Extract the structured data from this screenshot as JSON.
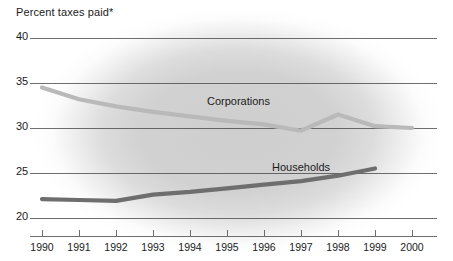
{
  "chart_data": {
    "type": "line",
    "title": "Percent taxes paid*",
    "xlabel": "",
    "ylabel": "",
    "x": [
      1990,
      1991,
      1992,
      1993,
      1994,
      1995,
      1996,
      1997,
      1998,
      1999,
      2000
    ],
    "categories": [
      "1990",
      "1991",
      "1992",
      "1993",
      "1994",
      "1995",
      "1996",
      "1997",
      "1998",
      "1999",
      "2000"
    ],
    "ylim": [
      20,
      40
    ],
    "yticks": [
      40,
      35,
      30,
      25,
      20
    ],
    "ytick_labels": [
      "40",
      "35",
      "30",
      "25",
      "20"
    ],
    "xlim": [
      1990,
      2000
    ],
    "grid": "horizontal",
    "legend": "inline-labels",
    "series": [
      {
        "name": "Corporations",
        "color": "#b9b9b9",
        "label_position": "above-line",
        "x": [
          1990,
          1991,
          1992,
          1993,
          1994,
          1995,
          1996,
          1997,
          1998,
          1999,
          2000
        ],
        "values": [
          34.5,
          33.2,
          32.4,
          31.8,
          31.3,
          30.8,
          30.4,
          29.7,
          31.5,
          30.2,
          30.0
        ]
      },
      {
        "name": "Households",
        "color": "#6e6e6e",
        "label_position": "above-line",
        "x": [
          1990,
          1991,
          1992,
          1993,
          1994,
          1995,
          1996,
          1997,
          1998,
          1999
        ],
        "values": [
          22.1,
          22.0,
          21.9,
          22.6,
          22.9,
          23.3,
          23.7,
          24.1,
          24.7,
          25.5
        ]
      }
    ]
  },
  "axis": {
    "y_labels": [
      "40",
      "35",
      "30",
      "25",
      "20"
    ],
    "x_labels": [
      "1990",
      "1991",
      "1992",
      "1993",
      "1994",
      "1995",
      "1996",
      "1997",
      "1998",
      "1999",
      "2000"
    ]
  },
  "labels": {
    "corporations": "Corporations",
    "households": "Households"
  },
  "colors": {
    "corporations_line": "#b9b9b9",
    "households_line": "#6e6e6e",
    "gridline": "#4a4a4a",
    "text": "#1b1b1b"
  }
}
